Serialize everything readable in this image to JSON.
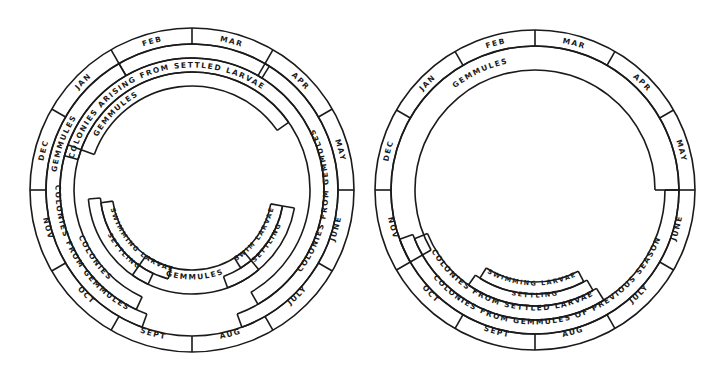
{
  "diagrams": [
    {
      "id": "left",
      "center": [
        192,
        190
      ],
      "month_ring": {
        "outer": 162,
        "inner": 146,
        "font": 7.5
      },
      "months": [
        "JAN",
        "FEB",
        "MAR",
        "APR",
        "MAY",
        "JUNE",
        "JULY",
        "AUG",
        "SEPT",
        "OCT",
        "NOV",
        "DEC"
      ],
      "bands": [
        {
          "label": "GEMMULES",
          "r_out": 146,
          "r_in": 132,
          "start": -30,
          "end": 32,
          "text_at": -70,
          "note": "outer gemmules arc Jan→Mar"
        },
        {
          "label": "COLONIES FROM GEMMULES",
          "r_out": 146,
          "r_in": 132,
          "start": 30,
          "end": 160,
          "text_at": 95
        },
        {
          "label": "COLONIES FROM GEMMULES",
          "r_out": 146,
          "r_in": 132,
          "start": 200,
          "end": 330,
          "text_at": 240
        },
        {
          "label": "COLONIES ARISING FROM SETTLED LARVAE",
          "r_out": 132,
          "r_in": 118,
          "start": -75,
          "end": 150,
          "text_at": -20
        },
        {
          "label": "COLONIES",
          "r_out": 132,
          "r_in": 118,
          "start": 205,
          "end": 290,
          "text_at": 235
        },
        {
          "label": "GEMMULES",
          "r_out": 118,
          "r_in": 104,
          "start": -70,
          "end": 55,
          "text_at": -45
        },
        {
          "label": "GEMMULES",
          "r_out": 104,
          "r_in": 80,
          "start": 140,
          "end": 215,
          "text_at": 178
        },
        {
          "label": "SETTLING",
          "r_out": 104,
          "r_in": 92,
          "start": 205,
          "end": 265,
          "text_at": 228
        },
        {
          "label": "SWIMMING LARVAE",
          "r_out": 92,
          "r_in": 80,
          "start": 195,
          "end": 262,
          "text_at": 225
        },
        {
          "label": "SETTLING",
          "r_out": 104,
          "r_in": 92,
          "start": 100,
          "end": 160,
          "text_at": 125
        },
        {
          "label": "SWIM LARVAE",
          "r_out": 92,
          "r_in": 80,
          "start": 100,
          "end": 148,
          "text_at": 125
        }
      ]
    },
    {
      "id": "right",
      "center": [
        535,
        190
      ],
      "month_ring": {
        "outer": 160,
        "inner": 144,
        "font": 7.5
      },
      "months": [
        "JAN",
        "FEB",
        "MAR",
        "APR",
        "MAY",
        "JUNE",
        "JULY",
        "AUG",
        "SEPT",
        "OCT",
        "NOV",
        "DEC"
      ],
      "bands": [
        {
          "label": "GEMMULES",
          "r_out": 144,
          "r_in": 120,
          "start": -120,
          "end": 90,
          "text_at": -25
        },
        {
          "label": "COLONIES FROM GEMMULES OF PREVIOUS SEASON",
          "r_out": 144,
          "r_in": 130,
          "start": 90,
          "end": 250,
          "text_at": 170
        },
        {
          "label": "COLONIES FROM SETTLED LARVAE",
          "r_out": 130,
          "r_in": 116,
          "start": 148,
          "end": 248,
          "text_at": 195
        },
        {
          "label": "SETTLING",
          "r_out": 116,
          "r_in": 104,
          "start": 150,
          "end": 215,
          "text_at": 180
        },
        {
          "label": "SWIMMING LARVAE",
          "r_out": 104,
          "r_in": 92,
          "start": 152,
          "end": 212,
          "text_at": 182
        }
      ]
    }
  ]
}
